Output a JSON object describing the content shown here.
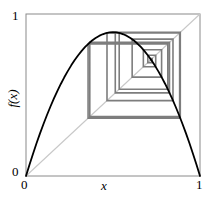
{
  "figure": {
    "title": "",
    "background_color": "#ffffff"
  },
  "axes": {
    "x_label": "x",
    "y_label": "f(x)",
    "x_ticks": [
      "0",
      "1"
    ],
    "y_ticks": [
      "0",
      "1"
    ],
    "x_tick_low": "0",
    "x_tick_high": "1",
    "y_tick_low": "0",
    "y_tick_high": "1",
    "frame_color": "#8a8a8a",
    "xlim": [
      0,
      1
    ],
    "ylim": [
      0,
      1
    ],
    "grid": false
  },
  "colors": {
    "curve": "#000000",
    "diagonal": "#c8c8c8",
    "cobweb": "#7d7d7d",
    "frame": "#8a8a8a",
    "text": "#000000"
  },
  "chart_data": {
    "type": "line",
    "title": "",
    "xlabel": "x",
    "ylabel": "f(x)",
    "xlim": [
      0,
      1
    ],
    "ylim": [
      0,
      1
    ],
    "xticks": [
      0,
      1
    ],
    "yticks": [
      0,
      1
    ],
    "xticklabels": [
      "0",
      "1"
    ],
    "yticklabels": [
      "0",
      "1"
    ],
    "grid": false,
    "legend": "none",
    "series": [
      {
        "name": "f(x) = r x (1 - x)",
        "type": "line",
        "color": "#000000",
        "linewidth": 1.8,
        "map_parameter_r": 3.55,
        "x": [
          0.0,
          0.02,
          0.04,
          0.06,
          0.08,
          0.1,
          0.12,
          0.14,
          0.16,
          0.18,
          0.2,
          0.22,
          0.24,
          0.26,
          0.28,
          0.3,
          0.32,
          0.34,
          0.36,
          0.38,
          0.4,
          0.42,
          0.44,
          0.46,
          0.48,
          0.5,
          0.52,
          0.54,
          0.56,
          0.58,
          0.6,
          0.62,
          0.64,
          0.66,
          0.68,
          0.7,
          0.72,
          0.74,
          0.76,
          0.78,
          0.8,
          0.82,
          0.84,
          0.86,
          0.88,
          0.9,
          0.92,
          0.94,
          0.96,
          0.98,
          1.0
        ],
        "y": [
          0.0,
          0.0696,
          0.1363,
          0.2002,
          0.2613,
          0.3195,
          0.3749,
          0.4274,
          0.4771,
          0.524,
          0.568,
          0.6092,
          0.6475,
          0.683,
          0.7156,
          0.7455,
          0.7724,
          0.7965,
          0.8178,
          0.8363,
          0.852,
          0.8648,
          0.8748,
          0.882,
          0.8863,
          0.8875,
          0.8863,
          0.882,
          0.8748,
          0.8648,
          0.852,
          0.8363,
          0.8178,
          0.7965,
          0.7724,
          0.7455,
          0.7156,
          0.683,
          0.6475,
          0.6092,
          0.568,
          0.524,
          0.4771,
          0.4274,
          0.3749,
          0.3195,
          0.2613,
          0.2002,
          0.1363,
          0.0696,
          0.0
        ]
      },
      {
        "name": "y = x (identity line)",
        "type": "line",
        "color": "#c8c8c8",
        "linewidth": 1.0,
        "x": [
          0,
          1
        ],
        "y": [
          0,
          1
        ]
      },
      {
        "name": "cobweb orbit",
        "type": "staircase",
        "color": "#7d7d7d",
        "linewidth": 1.6,
        "iterates": [
          0.7178,
          0.7192,
          0.7155,
          0.7251,
          0.7001,
          0.7455,
          0.6745,
          0.7793,
          0.6101,
          0.8447,
          0.4655,
          0.883,
          0.3666,
          0.8246,
          0.5131,
          0.8867,
          0.3568,
          0.8148,
          0.5357,
          0.8829
        ]
      }
    ],
    "annotations": [
      {
        "text": "0",
        "position": "y-axis-bottom"
      },
      {
        "text": "1",
        "position": "y-axis-top"
      },
      {
        "text": "0",
        "position": "x-axis-left"
      },
      {
        "text": "1",
        "position": "x-axis-right"
      }
    ]
  }
}
